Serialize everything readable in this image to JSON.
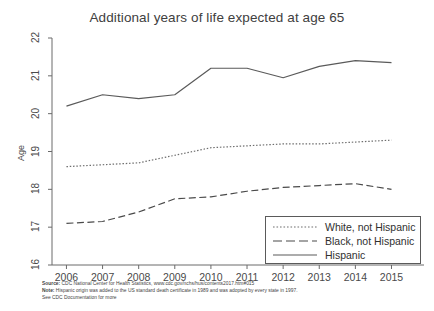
{
  "chart_data": {
    "type": "line",
    "title": "Additional years of life expected at age 65",
    "xlabel": "",
    "ylabel": "Age",
    "x": [
      2006,
      2007,
      2008,
      2009,
      2010,
      2011,
      2012,
      2013,
      2014,
      2015
    ],
    "xlim": [
      2005.6,
      2015.9
    ],
    "ylim": [
      16,
      22
    ],
    "yticks": [
      16,
      17,
      18,
      19,
      20,
      21,
      22
    ],
    "xticks": [
      "2006",
      "2007",
      "2008",
      "2009",
      "2010",
      "2011",
      "2012",
      "2013",
      "2014",
      "2015"
    ],
    "grid": false,
    "legend_position": "lower right",
    "series": [
      {
        "name": "White, not Hispanic",
        "style": "dotted",
        "color": "#6e6e6e",
        "values": [
          18.6,
          18.65,
          18.7,
          18.9,
          19.1,
          19.15,
          19.2,
          19.2,
          19.25,
          19.3
        ]
      },
      {
        "name": "Black, not Hispanic",
        "style": "dashed",
        "color": "#4a4a4a",
        "values": [
          17.1,
          17.15,
          17.4,
          17.75,
          17.8,
          17.95,
          18.05,
          18.1,
          18.15,
          18.0
        ]
      },
      {
        "name": "Hispanic",
        "style": "solid",
        "color": "#5a5a5a",
        "values": [
          20.2,
          20.5,
          20.4,
          20.5,
          21.2,
          21.2,
          20.95,
          21.25,
          21.4,
          21.35
        ]
      }
    ]
  },
  "footer": {
    "source_label": "Source:",
    "source_text": " CDC National Center for Health Statistics, www.cdc.gov/nchs/hus/contents2017.htm#015",
    "note_label": "Note:",
    "note_text": " Hispanic origin was added to the US standard death certificate in 1989 and was adopted by every state in 1997.",
    "doc_text": "See CDC Documentation for more"
  }
}
